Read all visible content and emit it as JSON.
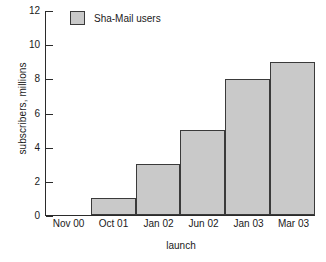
{
  "chart_data": {
    "type": "bar",
    "title": "",
    "subtitle": "",
    "categories": [
      "Nov 00",
      "Oct 01",
      "Jan 02",
      "Jun 02",
      "Jan 03",
      "Mar 03"
    ],
    "values": [
      0,
      1,
      3,
      5,
      8,
      9
    ],
    "series": [
      {
        "name": "Sha-Mail users",
        "values": [
          0,
          1,
          3,
          5,
          8,
          9
        ]
      }
    ],
    "xlabel": "launch",
    "ylabel": "subscribers, millions",
    "ylim": [
      0,
      12
    ],
    "yticks": [
      0,
      2,
      4,
      6,
      8,
      10,
      12
    ],
    "ytick_labels": [
      "0",
      "2",
      "4",
      "6",
      "8",
      "10",
      "12"
    ],
    "grid": false,
    "legend": {
      "position": "top-left-inside",
      "entries": [
        {
          "label": "Sha-Mail users",
          "color": "#c9c9c9"
        }
      ]
    },
    "colors": {
      "bar_fill": "#c9c9c9",
      "bar_edge": "#3a3a3a",
      "axis": "#2b2b2b",
      "text": "#1a1a1a",
      "background": "#ffffff"
    }
  }
}
